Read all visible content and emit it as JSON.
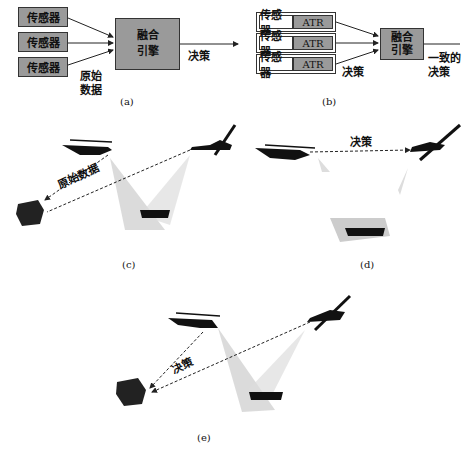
{
  "panel_a": {
    "sensors": [
      "传感器",
      "传感器",
      "传感器"
    ],
    "engine_line1": "融合",
    "engine_line2": "引擎",
    "raw_line1": "原始",
    "raw_line2": "数据",
    "output": "决策",
    "caption": "(a)"
  },
  "panel_b": {
    "rows": [
      {
        "sensor": "传感器",
        "atr": "ATR"
      },
      {
        "sensor": "传感器",
        "atr": "ATR"
      },
      {
        "sensor": "传感器",
        "atr": "ATR"
      }
    ],
    "engine_line1": "融合",
    "engine_line2": "引擎",
    "input_label": "决策",
    "output_line1": "一致的",
    "output_line2": "决策",
    "caption": "(b)"
  },
  "panel_c": {
    "link_label": "原始数据",
    "caption": "(c)"
  },
  "panel_d": {
    "link_label": "决策",
    "caption": "(d)"
  },
  "panel_e": {
    "link_label": "决策",
    "caption": "(e)"
  },
  "colors": {
    "box_fill": "#9a9a9a",
    "beam": "#cfcfcf",
    "silhouette": "#111111"
  }
}
